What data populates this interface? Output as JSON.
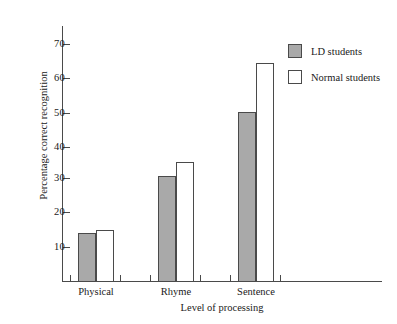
{
  "chart_data": {
    "type": "bar",
    "title": "",
    "xlabel": "Level of processing",
    "ylabel": "Percentage correct recognition",
    "categories": [
      "Physical",
      "Rhyme",
      "Sentence"
    ],
    "series": [
      {
        "name": "LD students",
        "color": "#a9a9a9",
        "values": [
          14,
          30.5,
          49
        ]
      },
      {
        "name": "Normal students",
        "color": "#ffffff",
        "values": [
          14.8,
          34.5,
          63.5
        ]
      }
    ],
    "ylim": [
      0,
      75
    ],
    "yticks": [
      10,
      20,
      30,
      40,
      50,
      60,
      70
    ],
    "ytick_labels": [
      "10",
      "20",
      "30",
      "40",
      "50",
      "60",
      "70"
    ],
    "grid": false,
    "legend_position": "top-right"
  },
  "legend": {
    "items": [
      {
        "label": "LD students",
        "swatch": "filled-gray-square"
      },
      {
        "label": "Normal students",
        "swatch": "open-white-square"
      }
    ]
  },
  "axes": {
    "y_title": "Percentage correct recognition",
    "x_title": "Level of processing",
    "y_tick_labels": [
      "70",
      "60",
      "50",
      "40",
      "30",
      "20",
      "10"
    ],
    "x_tick_labels": [
      "Physical",
      "Rhyme",
      "Sentence"
    ]
  }
}
